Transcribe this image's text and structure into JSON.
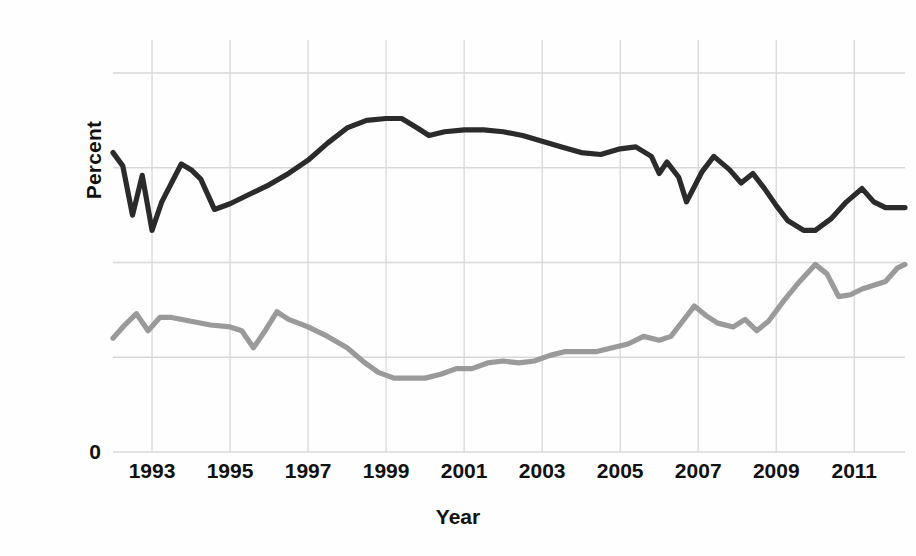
{
  "chart_data": {
    "type": "line",
    "title": "",
    "subtitle": "",
    "xlabel": "Year",
    "ylabel": "Percent",
    "xlim": [
      1992.0,
      2012.3
    ],
    "ylim": [
      0,
      100
    ],
    "grid": true,
    "legend_position": "none",
    "x_tick_labels": [
      "1993",
      "1995",
      "1997",
      "1999",
      "2001",
      "2003",
      "2005",
      "2007",
      "2009",
      "2011"
    ],
    "x_tick_values": [
      1993,
      1995,
      1997,
      1999,
      2001,
      2003,
      2005,
      2007,
      2009,
      2011
    ],
    "y_tick_labels": [
      "0"
    ],
    "y_tick_values": [
      0
    ],
    "y_gridline_values": [
      0,
      25,
      50,
      75,
      100
    ],
    "colors": {
      "series_dark": "#2b2b2b",
      "series_gray": "#9a9a9a",
      "grid": "#d8d8d8",
      "axis_text": "#111111",
      "background": "#fefefe"
    },
    "series": [
      {
        "name": "dark-series",
        "color": "#2b2b2b",
        "x": [
          1992.0,
          1992.25,
          1992.5,
          1992.75,
          1993.0,
          1993.25,
          1993.75,
          1994.0,
          1994.25,
          1994.6,
          1995.0,
          1995.5,
          1996.0,
          1996.5,
          1997.0,
          1997.5,
          1998.0,
          1998.5,
          1999.0,
          1999.4,
          1999.8,
          2000.1,
          2000.5,
          2001.0,
          2001.5,
          2002.0,
          2002.5,
          2003.0,
          2003.5,
          2004.0,
          2004.5,
          2005.0,
          2005.4,
          2005.8,
          2006.0,
          2006.2,
          2006.5,
          2006.7,
          2006.9,
          2007.1,
          2007.4,
          2007.8,
          2008.1,
          2008.4,
          2008.7,
          2009.0,
          2009.3,
          2009.7,
          2010.0,
          2010.4,
          2010.8,
          2011.2,
          2011.5,
          2011.8,
          2012.1,
          2012.3
        ],
        "y": [
          79.0,
          75.5,
          62.5,
          73.0,
          58.5,
          66.0,
          76.0,
          74.5,
          72.0,
          64.0,
          65.5,
          68.0,
          70.5,
          73.5,
          77.0,
          81.5,
          85.5,
          87.5,
          88.0,
          88.0,
          85.5,
          83.5,
          84.5,
          85.0,
          85.0,
          84.5,
          83.5,
          82.0,
          80.5,
          79.0,
          78.5,
          80.0,
          80.5,
          78.0,
          73.5,
          76.5,
          72.5,
          66.0,
          70.0,
          74.0,
          78.0,
          74.5,
          71.0,
          73.5,
          69.5,
          65.0,
          61.0,
          58.5,
          58.5,
          61.5,
          66.0,
          69.5,
          66.0,
          64.5,
          64.5,
          64.5
        ]
      },
      {
        "name": "gray-series",
        "color": "#9a9a9a",
        "x": [
          1992.0,
          1992.3,
          1992.6,
          1992.9,
          1993.2,
          1993.5,
          1994.0,
          1994.5,
          1995.0,
          1995.3,
          1995.6,
          1995.9,
          1996.2,
          1996.5,
          1997.0,
          1997.5,
          1998.0,
          1998.4,
          1998.8,
          1999.2,
          1999.6,
          2000.0,
          2000.4,
          2000.8,
          2001.2,
          2001.6,
          2002.0,
          2002.4,
          2002.8,
          2003.2,
          2003.6,
          2004.0,
          2004.4,
          2004.8,
          2005.2,
          2005.6,
          2006.0,
          2006.3,
          2006.6,
          2006.9,
          2007.2,
          2007.5,
          2007.9,
          2008.2,
          2008.5,
          2008.8,
          2009.2,
          2009.6,
          2010.0,
          2010.3,
          2010.6,
          2010.9,
          2011.2,
          2011.5,
          2011.8,
          2012.1,
          2012.3
        ],
        "y": [
          30.0,
          33.5,
          36.5,
          32.0,
          35.5,
          35.5,
          34.5,
          33.5,
          33.0,
          32.0,
          27.5,
          32.0,
          37.0,
          35.0,
          33.0,
          30.5,
          27.5,
          24.0,
          21.0,
          19.5,
          19.5,
          19.5,
          20.5,
          22.0,
          22.0,
          23.5,
          24.0,
          23.5,
          24.0,
          25.5,
          26.5,
          26.5,
          26.5,
          27.5,
          28.5,
          30.5,
          29.5,
          30.5,
          34.5,
          38.5,
          36.0,
          34.0,
          33.0,
          35.0,
          32.0,
          34.5,
          40.0,
          45.0,
          49.5,
          47.0,
          41.0,
          41.5,
          43.0,
          44.0,
          45.0,
          48.5,
          49.5
        ]
      }
    ]
  },
  "axes": {
    "y_title": "Percent",
    "x_title": "Year",
    "y_zero_label": "0"
  }
}
